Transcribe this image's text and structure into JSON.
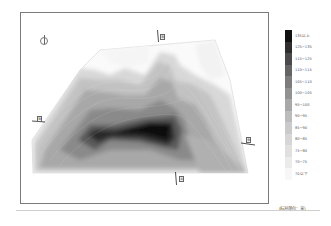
{
  "map": {
    "type": "topographic elevation contour map",
    "north_label": "N",
    "sections": [
      {
        "id": "top",
        "label": "B"
      },
      {
        "id": "left",
        "label": "B"
      },
      {
        "id": "right",
        "label": "B"
      },
      {
        "id": "bottom",
        "label": "A"
      }
    ]
  },
  "legend": {
    "title": "",
    "items": [
      {
        "label": "135以上",
        "color": "#111111"
      },
      {
        "label": "125~135",
        "color": "#2e2e2e"
      },
      {
        "label": "115~125",
        "color": "#4a4a4a"
      },
      {
        "label": "110~115",
        "color": "#646464"
      },
      {
        "label": "105~110",
        "color": "#7c7c7c"
      },
      {
        "label": "100~105",
        "color": "#929292"
      },
      {
        "label": "95~100",
        "color": "#a8a8a8"
      },
      {
        "label": "90~95",
        "color": "#bcbcbc"
      },
      {
        "label": "85~90",
        "color": "#cacaca"
      },
      {
        "label": "80~85",
        "color": "#d6d6d6"
      },
      {
        "label": "75~80",
        "color": "#e0e0e0"
      },
      {
        "label": "70~75",
        "color": "#ebebeb"
      },
      {
        "label": "70以下",
        "color": "#f7f7f7"
      }
    ]
  },
  "caption": "（标高单位：米）"
}
